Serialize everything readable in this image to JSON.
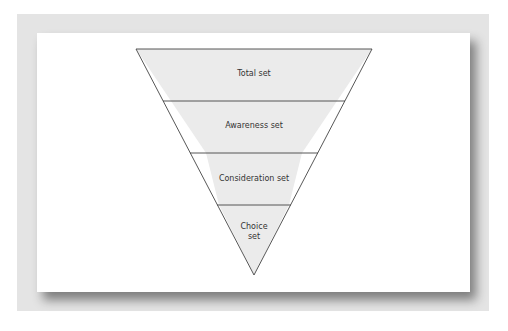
{
  "diagram": {
    "type": "inverted-funnel",
    "levels": [
      {
        "label": "Total set"
      },
      {
        "label": "Awareness set"
      },
      {
        "label": "Consideration set"
      },
      {
        "label": "Choice",
        "label2": "set"
      }
    ],
    "colors": {
      "fill": "#ebebeb",
      "stroke": "#444444",
      "frame": "#e4e4e4",
      "panel": "#ffffff"
    }
  }
}
